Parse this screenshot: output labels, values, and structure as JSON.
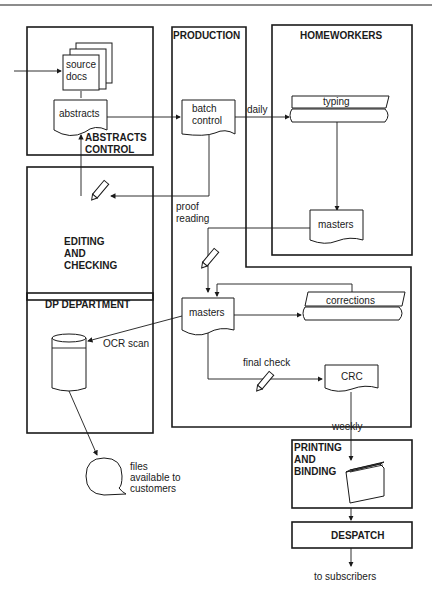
{
  "diagram": {
    "departments": {
      "abstracts_control": "ABSTRACTS",
      "abstracts_control_2": "CONTROL",
      "production": "PRODUCTION",
      "homeworkers": "HOMEWORKERS",
      "editing_1": "EDITING",
      "editing_2": "AND",
      "editing_3": "CHECKING",
      "dp_department": "DP DEPARTMENT",
      "printing_1": "PRINTING",
      "printing_2": "AND",
      "printing_3": "BINDING",
      "despatch": "DESPATCH"
    },
    "nodes": {
      "source_docs_1": "source",
      "source_docs_2": "docs",
      "abstracts": "abstracts",
      "batch_control_1": "batch",
      "batch_control_2": "control",
      "typing": "typing",
      "masters_homeworkers": "masters",
      "masters_production": "masters",
      "corrections": "corrections",
      "crc": "CRC",
      "files_1": "files",
      "files_2": "available to",
      "files_3": "customers"
    },
    "edge_labels": {
      "daily": "daily",
      "proof_1": "proof",
      "proof_2": "reading",
      "ocr_scan": "OCR scan",
      "final_check": "final check",
      "weekly": "weekly",
      "to_subscribers": "to subscribers"
    }
  }
}
